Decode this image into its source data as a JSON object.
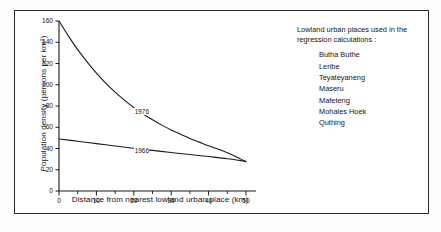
{
  "figure": {
    "background_color": "#ffffff",
    "frame_color": "#2a2a2a"
  },
  "chart_data": {
    "type": "line",
    "title": "",
    "xlabel": "Distance from nearest lowland urban place (km)",
    "ylabel": "Population density (persons per km²)",
    "xlim": [
      0,
      50
    ],
    "ylim": [
      0,
      160
    ],
    "xticks": [
      0,
      10,
      20,
      30,
      40,
      50
    ],
    "xticklabels": [
      "0",
      "10",
      "20",
      "30",
      "40",
      "50"
    ],
    "xminorticks": [
      5,
      15,
      25,
      35,
      45
    ],
    "yticks": [
      0,
      20,
      40,
      60,
      80,
      100,
      120,
      140,
      160
    ],
    "yticklabels": [
      "0",
      "20",
      "40",
      "60",
      "80",
      "100",
      "120",
      "140",
      "160"
    ],
    "grid": false,
    "legend_position": "inline-curve-labels",
    "series": [
      {
        "name": "1976",
        "label": "1976",
        "color": "#1a1a1a",
        "label_x": 22,
        "label_y": 74,
        "x": [
          0,
          2.5,
          5,
          7.5,
          10,
          12.5,
          15,
          17.5,
          20,
          22.5,
          25,
          27.5,
          30,
          32.5,
          35,
          37.5,
          40,
          42.5,
          45,
          47.5,
          50
        ],
        "y": [
          160,
          146,
          133,
          121.5,
          111,
          101.5,
          93,
          85.5,
          78.5,
          72.5,
          67,
          62,
          57.5,
          53.5,
          49.5,
          46,
          42.5,
          39.5,
          36,
          32,
          27.5
        ]
      },
      {
        "name": "1966",
        "label": "1966",
        "color": "#1a1a1a",
        "label_x": 22,
        "label_y": 38,
        "x": [
          0,
          5,
          10,
          15,
          20,
          25,
          30,
          35,
          40,
          45,
          50
        ],
        "y": [
          49,
          46.8,
          44.6,
          42.4,
          40.2,
          38.2,
          36.2,
          34.3,
          32.4,
          30.4,
          28
        ]
      }
    ]
  },
  "note": {
    "heading": "Lowland urban places used in the regression calculations :",
    "places": [
      "Butha Buthe",
      "Leribe",
      "Teyateyaneng",
      "Maseru",
      "Mafeteng",
      "Mohales Hoek",
      "Quthing"
    ]
  }
}
